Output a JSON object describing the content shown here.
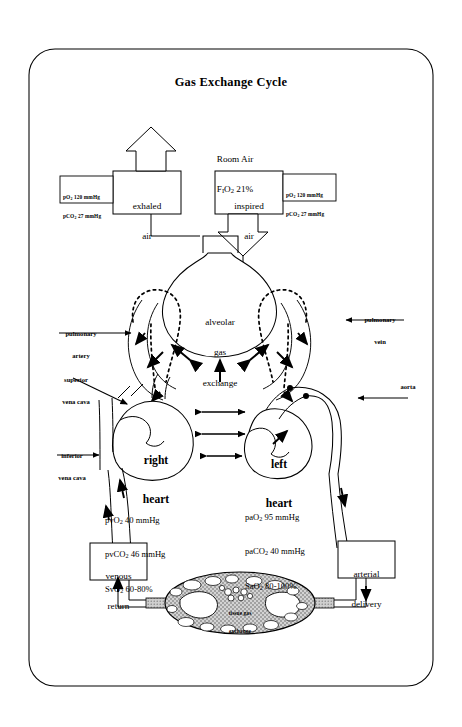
{
  "title": "Gas Exchange Cycle",
  "room_air": {
    "line1": "Room Air",
    "line2_pre": "F",
    "line2_sub": "I",
    "line2_post": "O",
    "line2_sub2": "2",
    "line2_val": " 21%"
  },
  "boxes": {
    "exhaled": {
      "line1": "exhaled",
      "line2": "air"
    },
    "inspired": {
      "line1": "inspired",
      "line2": "air"
    },
    "venous_return": {
      "line1": "venous",
      "line2": "return"
    },
    "arterial_delivery": {
      "line1": "arterial",
      "line2": "delivery"
    }
  },
  "alveolar": {
    "line1": "alveolar",
    "line2": "gas",
    "line3": "exchange"
  },
  "tissue": {
    "line1": "tissue gas",
    "line2": "exchange"
  },
  "hearts": {
    "right_line1": "right",
    "right_line2": "heart",
    "left_line1": "left",
    "left_line2": "heart"
  },
  "vessels": {
    "pulmonary_artery_l1": "pulmonary",
    "pulmonary_artery_l2": "artery",
    "pulmonary_vein_l1": "pulmonary",
    "pulmonary_vein_l2": "vein",
    "superior_vc_l1": "superior",
    "superior_vc_l2": "vena cava",
    "inferior_vc_l1": "inferior",
    "inferior_vc_l2": "vena cava",
    "aorta": "aorta"
  },
  "gas_values": {
    "exhaled_po2": "pO2 120 mmHg",
    "exhaled_pco2": "pCO2 27 mmHg",
    "inspired_po2": "pO2 120 mmHg",
    "inspired_pco2": "pCO2 27 mmHg",
    "venous": [
      "pvO2 40 mmHg",
      "pvCO2 46 mmHg",
      "SvO2 60-80%"
    ],
    "arterial": [
      "paO2 95 mmHg",
      "paCO2 40 mmHg",
      "SaO2 80-100%"
    ]
  },
  "colors": {
    "ink": "#000000",
    "paper": "#ffffff",
    "tissue_fill": "#b9b9b9",
    "vessel_fill": "#c9c9c9"
  }
}
